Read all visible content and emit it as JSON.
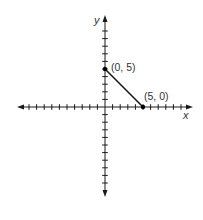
{
  "chart_data": {
    "type": "line",
    "title": "",
    "xlabel": "x",
    "ylabel": "y",
    "xlim": [
      -10,
      10
    ],
    "ylim": [
      -10,
      10
    ],
    "tick_interval": 1,
    "grid": false,
    "series": [
      {
        "name": "segment",
        "points": [
          {
            "x": 0,
            "y": 5,
            "label": "(0, 5)"
          },
          {
            "x": 5,
            "y": 0,
            "label": "(5, 0)"
          }
        ]
      }
    ]
  },
  "axes": {
    "x_label": "x",
    "y_label": "y"
  },
  "points": {
    "p1_label": "(0, 5)",
    "p2_label": "(5, 0)"
  },
  "colors": {
    "ink": "#1a1a1a",
    "background": "#ffffff"
  }
}
